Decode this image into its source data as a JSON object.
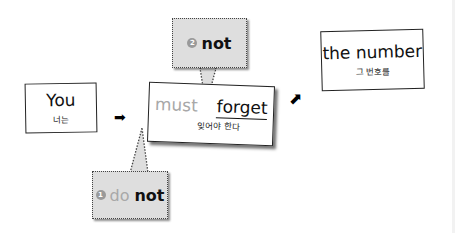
{
  "diagram": {
    "boxes": [
      {
        "id": "subject",
        "english": "You",
        "korean": "너는"
      },
      {
        "id": "verb",
        "english_muted": "must",
        "english_main": "forget",
        "korean": "잊어야 한다"
      },
      {
        "id": "object",
        "english": "the number",
        "korean": "그 번호를"
      }
    ],
    "callouts": [
      {
        "number": "1",
        "muted": "do",
        "bold": "not"
      },
      {
        "number": "2",
        "bold": "not"
      }
    ],
    "arrows": [
      {
        "glyph": "➡"
      },
      {
        "glyph": "⬈"
      }
    ],
    "colors": {
      "callout_fill": "#dedede",
      "muted_text": "#a8a8a8",
      "number_badge": "#9a9a9a"
    }
  }
}
